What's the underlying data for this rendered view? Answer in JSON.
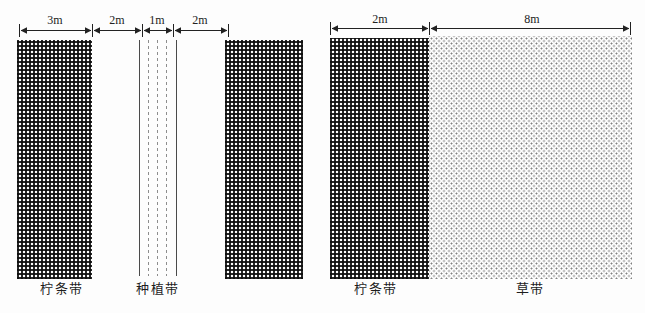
{
  "figure": {
    "description": "Schematic plan of caragana shrub belts: left plot shows 3m caragana belt, 2m gap, 1m planting belt, 2m gap; right plot shows 2m caragana belt beside 8m grass belt",
    "colors": {
      "ink": "#222222",
      "rail_solid": "#4a4a4a",
      "rail_dashed": "#8d8d8d",
      "grass_dot": "#808080",
      "background": "#fdfdfd"
    },
    "patterns": {
      "caragana_belt": "dense black gingham weave",
      "grass_belt": "light staggered gray dots",
      "planting_belt": "two solid rails with three dashed seed rows"
    }
  },
  "left_plot": {
    "dim_labels": [
      "3m",
      "2m",
      "1m",
      "2m"
    ],
    "dims_m": [
      3,
      2,
      1,
      2
    ],
    "labels": {
      "caragana": "柠条带",
      "planting": "种植带"
    }
  },
  "right_plot": {
    "dim_labels": [
      "2m",
      "8m"
    ],
    "dims_m": [
      2,
      8
    ],
    "labels": {
      "caragana": "柠条带",
      "grass": "草带"
    }
  }
}
